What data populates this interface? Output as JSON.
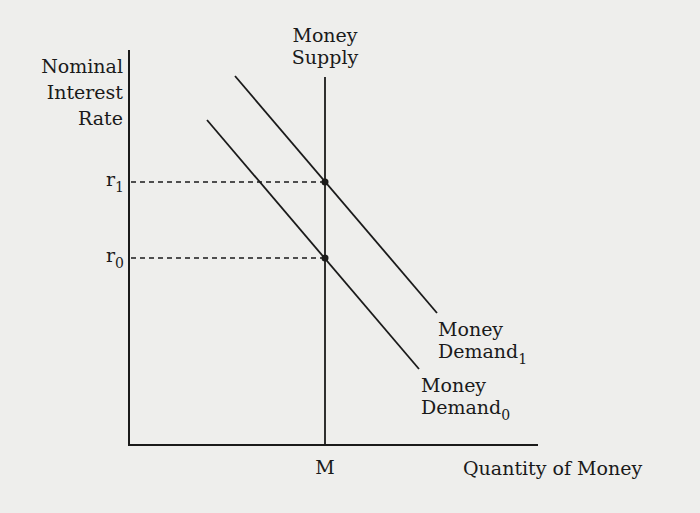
{
  "diagram": {
    "type": "money-market-supply-demand",
    "y_axis_label": [
      "Nominal",
      "Interest",
      "Rate"
    ],
    "x_axis_label": "Quantity of Money",
    "money_supply_label": [
      "Money",
      "Supply"
    ],
    "money_supply_quantity_label": "M",
    "rate_labels": {
      "r1": {
        "base": "r",
        "sub": "1"
      },
      "r0": {
        "base": "r",
        "sub": "0"
      }
    },
    "demand_curves": [
      {
        "name": "Money Demand_0",
        "line1": "Money",
        "line2_base": "Demand",
        "line2_sub": "0"
      },
      {
        "name": "Money Demand_1",
        "line1": "Money",
        "line2_base": "Demand",
        "line2_sub": "1"
      }
    ],
    "colors": {
      "ink": "#1a1a1a",
      "paper": "#eeeeec"
    }
  }
}
